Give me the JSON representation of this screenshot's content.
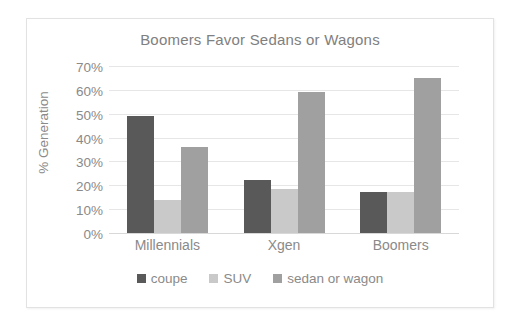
{
  "chart_data": {
    "type": "bar",
    "title": "Boomers Favor Sedans or Wagons",
    "xlabel": "",
    "ylabel": "% Generation",
    "categories": [
      "Millennials",
      "Xgen",
      "Boomers"
    ],
    "series": [
      {
        "name": "coupe",
        "color": "#595959",
        "values": [
          49.5,
          22.5,
          17.8
        ]
      },
      {
        "name": "SUV",
        "color": "#c9c9c9",
        "values": [
          14.2,
          18.8,
          17.8
        ]
      },
      {
        "name": "sedan or wagon",
        "color": "#a0a0a0",
        "values": [
          36.5,
          59.5,
          65.5
        ]
      }
    ],
    "ylim": [
      0,
      70
    ],
    "ytick_values": [
      0,
      10,
      20,
      30,
      40,
      50,
      60,
      70
    ],
    "ytick_labels": [
      "0%",
      "10%",
      "20%",
      "30%",
      "40%",
      "50%",
      "60%",
      "70%"
    ],
    "grid": true,
    "legend_position": "bottom"
  },
  "colors": {
    "title_text": "#808080",
    "axis_text": "#8a8a8a",
    "gridline": "#e6e6e6",
    "frame_border": "#e2e2e2",
    "plot_background": "#ffffff"
  }
}
